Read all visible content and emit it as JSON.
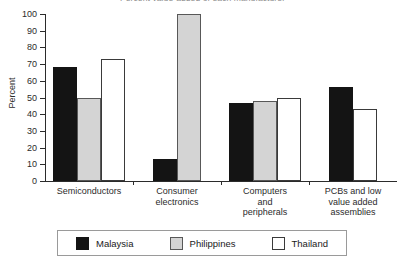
{
  "chart_data": {
    "type": "bar",
    "title": "Percent value-added of each manufacturer",
    "xlabel": "",
    "ylabel": "Percent",
    "ylim": [
      0,
      100
    ],
    "ytick_step": 10,
    "yticks": [
      0,
      10,
      20,
      30,
      40,
      50,
      60,
      70,
      80,
      90,
      100
    ],
    "grid": false,
    "legend_position": "bottom",
    "categories": [
      "Semiconductors",
      "Consumer\nelectronics",
      "Computers\nand\nperipherals",
      "PCBs and low\nvalue added\nassemblies"
    ],
    "series": [
      {
        "name": "Malaysia",
        "color": "#141414",
        "values": [
          68,
          13,
          47,
          56
        ]
      },
      {
        "name": "Philippines",
        "color": "#d4d4d4",
        "values": [
          50,
          100,
          48,
          null
        ]
      },
      {
        "name": "Thailand",
        "color": "#ffffff",
        "values": [
          73,
          null,
          50,
          43
        ]
      }
    ]
  },
  "legend": {
    "items": [
      {
        "label": "Malaysia",
        "swatch": "malaysia"
      },
      {
        "label": "Philippines",
        "swatch": "philippines"
      },
      {
        "label": "Thailand",
        "swatch": "thailand"
      }
    ]
  }
}
